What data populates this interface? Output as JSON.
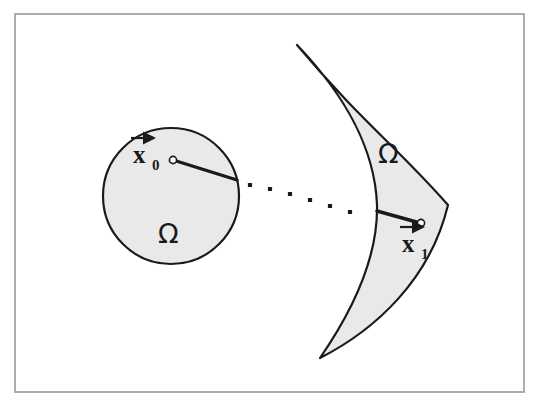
{
  "figure": {
    "frame": {
      "name": "figure-border",
      "x": 15,
      "y": 14,
      "width": 509,
      "height": 378,
      "stroke": "#9a9a9a",
      "stroke_width": 1.6,
      "background": "#ffffff"
    },
    "colors": {
      "fill_gray": "#e9e9e9",
      "outline": "#1a1a1a",
      "text": "#1a1a1a",
      "frame": "#9a9a9a",
      "marker_fill": "#ffffff"
    },
    "shapes": [
      {
        "name": "left-domain-circle",
        "type": "circle",
        "cx": 171,
        "cy": 196,
        "r": 68,
        "fill": "#e9e9e9",
        "stroke": "#1a1a1a",
        "stroke_width": 2.2
      },
      {
        "name": "right-domain-crescent",
        "type": "crescent",
        "path": "M 297 45 C 360 120 400 150 448 205 C 430 280 375 330 320 358 C 360 300 378 250 377 205 C 375 150 345 95 297 45 Z",
        "fill": "#e9e9e9",
        "stroke": "#1a1a1a",
        "stroke_width": 2.2,
        "top_tip": [
          297,
          45
        ],
        "bottom_tip": [
          320,
          358
        ],
        "rightmost_x": 448
      }
    ],
    "radii": [
      {
        "name": "left-radius-line",
        "from": [
          173,
          160
        ],
        "to": [
          237,
          180
        ],
        "stroke": "#1a1a1a",
        "stroke_width": 3.4
      },
      {
        "name": "right-radius-line",
        "from": [
          377,
          211
        ],
        "to": [
          420,
          223
        ],
        "stroke": "#1a1a1a",
        "stroke_width": 3.4
      }
    ],
    "markers": [
      {
        "name": "point-x0-marker",
        "cx": 173,
        "cy": 160,
        "r": 3.6,
        "fill": "#ffffff",
        "stroke": "#1a1a1a",
        "stroke_width": 1.6
      },
      {
        "name": "point-x1-marker",
        "cx": 421,
        "cy": 223,
        "r": 3.6,
        "fill": "#ffffff",
        "stroke": "#1a1a1a",
        "stroke_width": 1.6
      }
    ],
    "dots": {
      "name": "dotted-trajectory",
      "count": 6,
      "size": 4.2,
      "color": "#1a1a1a",
      "points": [
        [
          250,
          185
        ],
        [
          270,
          189
        ],
        [
          290,
          194
        ],
        [
          310,
          200
        ],
        [
          330,
          206
        ],
        [
          350,
          212
        ]
      ]
    },
    "labels": [
      {
        "name": "label-x0",
        "base": "x",
        "subscript": "0",
        "arrow": "vector-arrow",
        "x": 133,
        "y": 163,
        "sub_x": 152,
        "sub_y": 170,
        "arrow_x1": 131,
        "arrow_x2": 154,
        "arrow_y": 138
      },
      {
        "name": "label-x1",
        "base": "x",
        "subscript": "1",
        "arrow": "vector-arrow",
        "x": 402,
        "y": 252,
        "sub_x": 421,
        "sub_y": 259,
        "arrow_x1": 400,
        "arrow_x2": 423,
        "arrow_y": 227
      },
      {
        "name": "label-omega-left",
        "text": "Ω",
        "x": 158,
        "y": 243
      },
      {
        "name": "label-omega-right",
        "text": "Ω",
        "x": 378,
        "y": 163
      }
    ]
  }
}
